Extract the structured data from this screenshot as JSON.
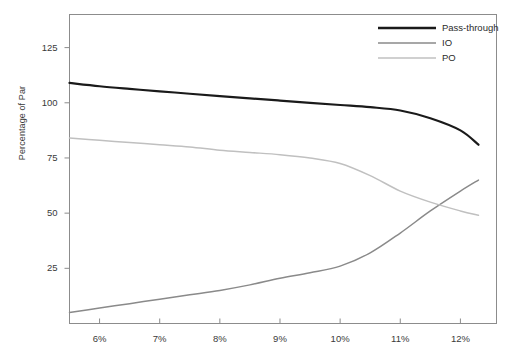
{
  "chart_data": {
    "type": "line",
    "title": "",
    "xlabel": "",
    "ylabel": "Percentage of Par",
    "xlim": [
      5.5,
      12.6
    ],
    "ylim": [
      0,
      140
    ],
    "grid": false,
    "legend_position": "top-right",
    "x_tick_labels": [
      "6%",
      "7%",
      "8%",
      "9%",
      "10%",
      "11%",
      "12%"
    ],
    "x_tick_values": [
      6,
      7,
      8,
      9,
      10,
      11,
      12
    ],
    "y_tick_labels": [
      "25",
      "50",
      "75",
      "100",
      "125"
    ],
    "y_tick_values": [
      25,
      50,
      75,
      100,
      125
    ],
    "x": [
      5.5,
      6,
      6.5,
      7,
      7.5,
      8,
      8.5,
      9,
      9.5,
      10,
      10.5,
      11,
      11.5,
      12,
      12.3
    ],
    "series": [
      {
        "name": "Pass-through",
        "color": "#1a1a1a",
        "width": 2.2,
        "values": [
          109,
          107.5,
          106.3,
          105.2,
          104.1,
          103.0,
          102.0,
          101.0,
          100.0,
          99.0,
          98.0,
          96.5,
          93.0,
          87.5,
          81
        ]
      },
      {
        "name": "IO",
        "color": "#8a8a8a",
        "width": 1.5,
        "values": [
          5,
          7,
          9,
          11,
          13,
          15,
          17.5,
          20.5,
          23,
          26,
          32,
          41,
          51,
          60,
          65
        ]
      },
      {
        "name": "PO",
        "color": "#c0c0c0",
        "width": 1.5,
        "values": [
          84,
          83,
          82,
          81,
          80,
          78.5,
          77.5,
          76.5,
          75,
          72.5,
          67,
          60,
          55,
          51,
          49
        ]
      }
    ],
    "annotations": {
      "crossover_note": "IO and PO cross near 11.2% at about 55"
    }
  },
  "legend": {
    "items": [
      {
        "label": "Pass-through",
        "color": "#1a1a1a"
      },
      {
        "label": "IO",
        "color": "#8a8a8a"
      },
      {
        "label": "PO",
        "color": "#c0c0c0"
      }
    ]
  },
  "frame": {
    "border_color": "#8c8c8c",
    "background": "#ffffff"
  }
}
